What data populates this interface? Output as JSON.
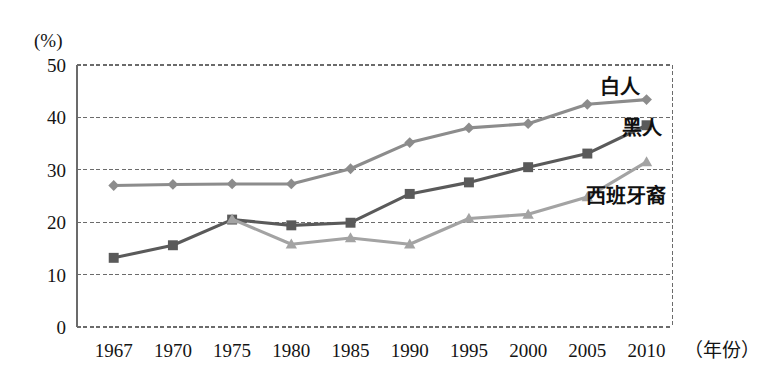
{
  "chart_data": {
    "type": "line",
    "title": "",
    "subtitle": "",
    "xlabel": "（年份）",
    "ylabel": "(%)",
    "unit_label": "(%)",
    "categories": [
      "1967",
      "1970",
      "1975",
      "1980",
      "1985",
      "1990",
      "1995",
      "2000",
      "2005",
      "2010"
    ],
    "x": [
      1967,
      1970,
      1975,
      1980,
      1985,
      1990,
      1995,
      2000,
      2005,
      2010
    ],
    "ylim": [
      0,
      50
    ],
    "ytick_labels": [
      "0",
      "10",
      "20",
      "30",
      "40",
      "50"
    ],
    "ytick_values": [
      0,
      10,
      20,
      30,
      40,
      50
    ],
    "grid": "horizontal-dashed",
    "legend_position": "inline-right-of-series",
    "series": [
      {
        "name": "白人",
        "marker": "diamond",
        "color": "#8c8c8c",
        "label_x": 2010,
        "label_y": 44.5,
        "values": [
          27.0,
          27.2,
          27.3,
          27.3,
          30.2,
          35.2,
          38.0,
          38.8,
          42.5,
          43.4
        ]
      },
      {
        "name": "黑人",
        "marker": "square",
        "color": "#5a5a5a",
        "label_x": 2010,
        "label_y": 39.5,
        "values": [
          13.2,
          15.6,
          20.5,
          19.4,
          19.9,
          25.4,
          27.6,
          30.5,
          33.1,
          38.5
        ]
      },
      {
        "name": "西班牙裔",
        "marker": "triangle",
        "color": "#a3a3a3",
        "label_x": 2005,
        "label_y": 26.5,
        "values": [
          null,
          null,
          20.6,
          15.8,
          17.0,
          15.8,
          20.7,
          21.5,
          24.8,
          31.5
        ]
      }
    ],
    "annotations": [
      {
        "text": "白人",
        "series": "白人"
      },
      {
        "text": "黑人",
        "series": "黑人"
      },
      {
        "text": "西班牙裔",
        "series": "西班牙裔"
      }
    ],
    "colors": {
      "white_series": "#8c8c8c",
      "black_series": "#5a5a5a",
      "hispanic_series": "#a3a3a3",
      "grid": "#6b6b6b",
      "frame": "#6b6b6b",
      "background": "#ffffff"
    }
  }
}
